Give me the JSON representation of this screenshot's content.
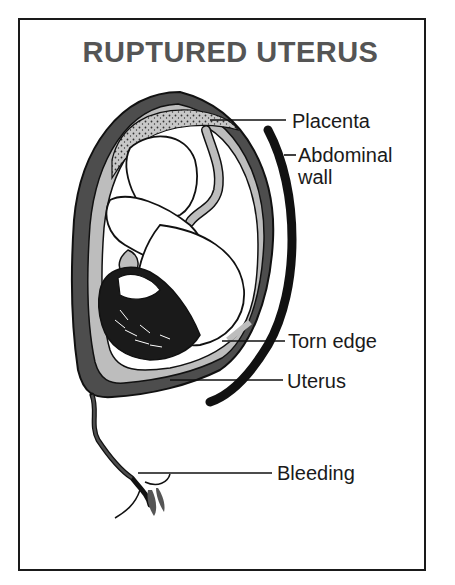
{
  "diagram": {
    "title": "RUPTURED UTERUS",
    "labels": [
      {
        "id": "placenta",
        "text": "Placenta"
      },
      {
        "id": "abdominal-wall",
        "text": "Abdominal wall"
      },
      {
        "id": "torn-edge",
        "text": "Torn edge"
      },
      {
        "id": "uterus",
        "text": "Uterus"
      },
      {
        "id": "bleeding",
        "text": "Bleeding"
      }
    ],
    "colors": {
      "uterus_wall": "#4d4d4d",
      "amniotic_fill": "#bdbdbd",
      "outline": "#111111",
      "title": "#555555",
      "background": "#ffffff"
    }
  }
}
